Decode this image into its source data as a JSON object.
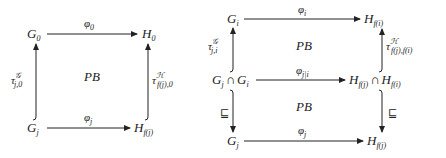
{
  "left_diagram": {
    "nodes": {
      "top_left": {
        "base": "G",
        "sub": "0"
      },
      "top_right": {
        "base": "H",
        "sub": "0"
      },
      "bottom_left": {
        "base": "G",
        "sub": "j"
      },
      "bottom_right": {
        "base": "H",
        "sub": "f(j)"
      }
    },
    "arrows": {
      "top": {
        "base": "φ",
        "sub": "0"
      },
      "bottom": {
        "base": "φ",
        "sub": "j"
      },
      "left": {
        "base": "τ",
        "sup": "𝒢",
        "sub": "j,0"
      },
      "right": {
        "base": "τ",
        "sup": "ℋ",
        "sub": "f(j),0"
      }
    },
    "center": "PB"
  },
  "right_diagram": {
    "nodes": {
      "top_left": {
        "base": "G",
        "sub": "i"
      },
      "top_right": {
        "base": "H",
        "sub": "f(i)"
      },
      "mid_left": {
        "base1": "G",
        "sub1": "j",
        "op": "∩",
        "base2": "G",
        "sub2": "i"
      },
      "mid_right": {
        "base1": "H",
        "sub1": "f(j)",
        "op": "∩",
        "base2": "H",
        "sub2": "f(i)"
      },
      "bottom_left": {
        "base": "G",
        "sub": "j"
      },
      "bottom_right": {
        "base": "H",
        "sub": "f(j)"
      }
    },
    "arrows": {
      "top": {
        "base": "φ",
        "sub": "i"
      },
      "middle": {
        "base": "φ",
        "sub": "j|i"
      },
      "bottom": {
        "base": "φ",
        "sub": "j"
      },
      "upper_left": {
        "base": "τ",
        "sup": "𝒢",
        "sub": "j,i"
      },
      "upper_right": {
        "base": "τ",
        "sup": "ℋ",
        "sub": "f(j),f(i)"
      },
      "lower_left": "⊑",
      "lower_right": "⊑"
    },
    "centers": [
      "PB",
      "PB"
    ]
  }
}
